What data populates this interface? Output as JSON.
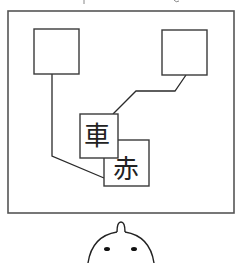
{
  "diagram": {
    "cards": [
      {
        "label": "車"
      },
      {
        "label": "赤"
      }
    ],
    "colors": {
      "frame": "#555555",
      "stroke": "#2a2a2a",
      "background": "#ffffff"
    }
  }
}
